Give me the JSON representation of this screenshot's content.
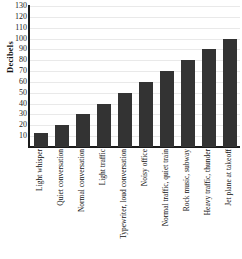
{
  "chart_data": {
    "type": "bar",
    "title": "",
    "xlabel": "",
    "ylabel": "Decibels",
    "ylim": [
      0,
      130
    ],
    "ytick_step": 10,
    "yticks": [
      130,
      120,
      110,
      100,
      90,
      80,
      70,
      60,
      50,
      40,
      30,
      20,
      10
    ],
    "grid": true,
    "legend": "none",
    "bar_color": "#333333",
    "axis_color": "#1b1b1b",
    "gridline_color": "#e9e9e9",
    "background_color": "#ffffff",
    "categories": [
      "Light whisper",
      "Quiet conversation",
      "Normal conversation",
      "Light traffic",
      "Typewriter, loud conversation",
      "Noisy office",
      "Normal traffic, quiet train",
      "Rock music, subway",
      "Heavy traffic, thunder",
      "Jet plane at takeoff"
    ],
    "values": [
      13,
      20,
      30,
      40,
      50,
      60,
      70,
      80,
      90,
      100
    ]
  }
}
